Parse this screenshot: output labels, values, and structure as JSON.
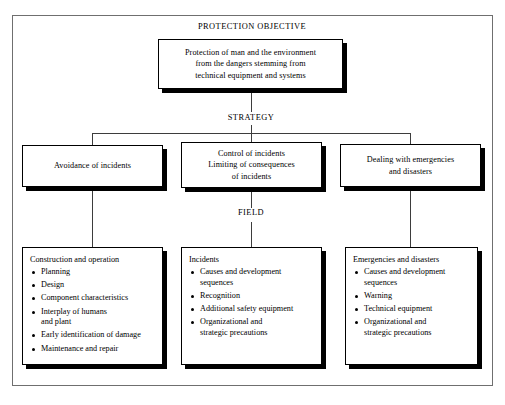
{
  "diagram": {
    "sections": {
      "objective_caption": "PROTECTION OBJECTIVE",
      "strategy_caption": "STRATEGY",
      "field_caption": "FIELD"
    },
    "objective_box": {
      "lines": [
        "Protection of man and the environment",
        "from the dangers stemming from",
        "technical equipment and systems"
      ]
    },
    "strategy_boxes": [
      {
        "lines": [
          "Avoidance of incidents"
        ]
      },
      {
        "lines": [
          "Control of incidents",
          "Limiting of consequences",
          "of incidents"
        ]
      },
      {
        "lines": [
          "Dealing with emergencies",
          "and disasters"
        ]
      }
    ],
    "field_boxes": [
      {
        "title": "Construction and operation",
        "items": [
          {
            "text": "Planning",
            "cont": ""
          },
          {
            "text": "Design",
            "cont": ""
          },
          {
            "text": "Component characteristics",
            "cont": ""
          },
          {
            "text": "Interplay of humans",
            "cont": "and plant"
          },
          {
            "text": "Early identification of damage",
            "cont": ""
          },
          {
            "text": "Maintenance and repair",
            "cont": ""
          }
        ]
      },
      {
        "title": "Incidents",
        "items": [
          {
            "text": "Causes and development",
            "cont": "sequences"
          },
          {
            "text": "Recognition",
            "cont": ""
          },
          {
            "text": "Additional safety equipment",
            "cont": ""
          },
          {
            "text": "Organizational and",
            "cont": "strategic precautions"
          }
        ]
      },
      {
        "title": "Emergencies and disasters",
        "items": [
          {
            "text": "Causes and development",
            "cont": "sequences"
          },
          {
            "text": "Warning",
            "cont": ""
          },
          {
            "text": "Technical equipment",
            "cont": ""
          },
          {
            "text": "Organizational and",
            "cont": "strategic precautions"
          }
        ]
      }
    ],
    "colors": {
      "line": "#3d3d3d",
      "border": "#000000",
      "shadow": "#000000",
      "frame": "#6f6f6f",
      "background": "#ffffff"
    }
  }
}
